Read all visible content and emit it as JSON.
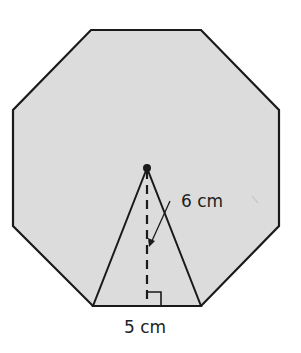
{
  "figure": {
    "shape": "regular octagon",
    "fill_color": "#dcdcdc",
    "stroke_color": "#1a1a1a",
    "height_label": "6 cm",
    "base_label": "5 cm",
    "annotations": [
      "center point",
      "triangle from center to one side",
      "dashed apothem with right-angle marker"
    ]
  }
}
